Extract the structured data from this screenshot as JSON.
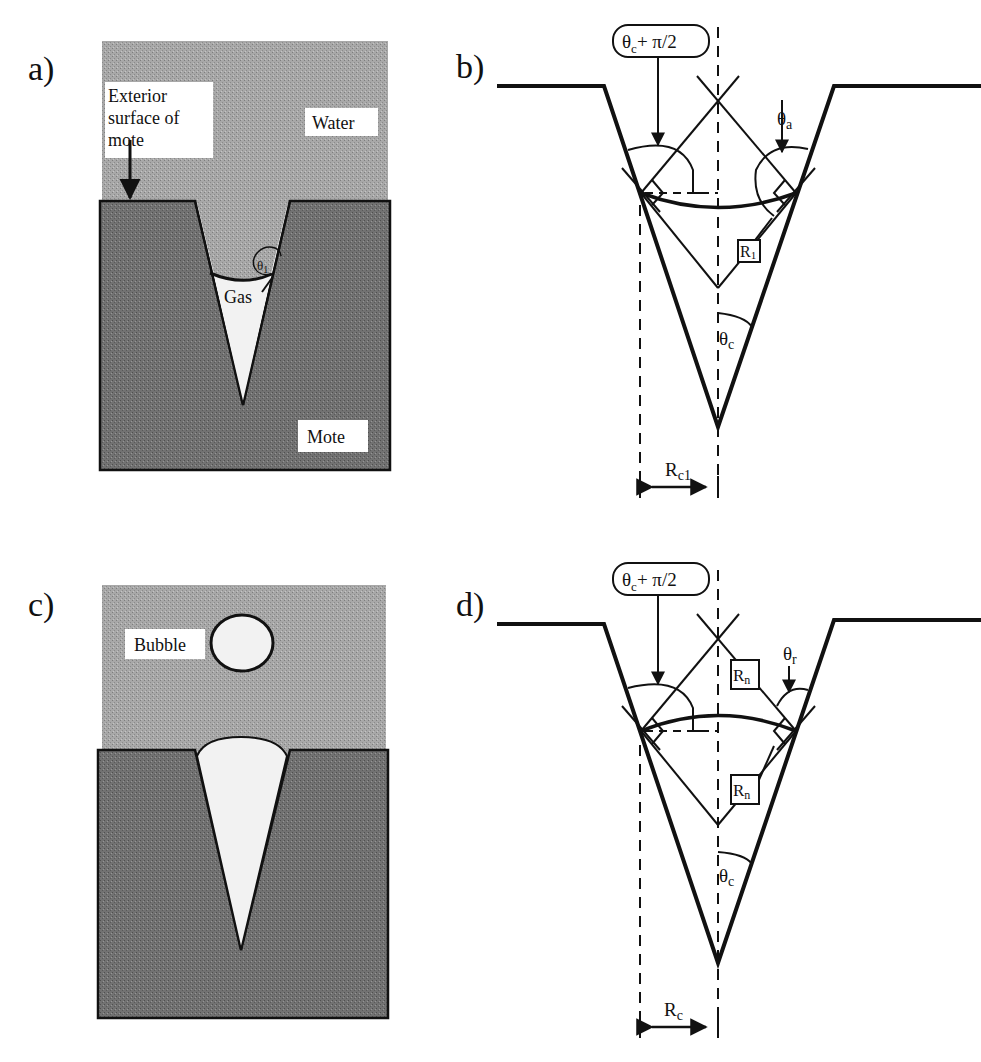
{
  "figure": {
    "panels": [
      {
        "id": "a",
        "letter": "a)",
        "labels": {
          "exterior_line1": "Exterior",
          "exterior_line2": "surface of",
          "exterior_line3": "mote",
          "water": "Water",
          "gas": "Gas",
          "mote": "Mote",
          "angle": "θ",
          "angle_sub": "1"
        }
      },
      {
        "id": "b",
        "letter": "b)",
        "labels": {
          "callout": "θc+ π/2",
          "callout_theta": "θ",
          "callout_sub": "c",
          "callout_rest": "+ π/2",
          "advancing_angle": "θ",
          "advancing_sub": "a",
          "radius_box": "R",
          "radius_sub": "1",
          "cone_angle": "θ",
          "cone_sub": "c",
          "width_label": "R",
          "width_sub": "c1"
        }
      },
      {
        "id": "c",
        "letter": "c)",
        "labels": {
          "bubble": "Bubble"
        }
      },
      {
        "id": "d",
        "letter": "d)",
        "labels": {
          "callout_theta": "θ",
          "callout_sub": "c",
          "callout_rest": "+ π/2",
          "receding_angle": "θ",
          "receding_sub": "r",
          "radius_box_top": "R",
          "radius_box_top_sub": "n",
          "radius_box_bottom": "R",
          "radius_box_bottom_sub": "n",
          "cone_angle": "θ",
          "cone_sub": "c",
          "width_label": "R",
          "width_sub": "c"
        }
      }
    ],
    "colors": {
      "water": "#a3a3a3",
      "mote": "#6f6f6f",
      "gas": "#f4f4f4",
      "line": "#111111"
    }
  }
}
